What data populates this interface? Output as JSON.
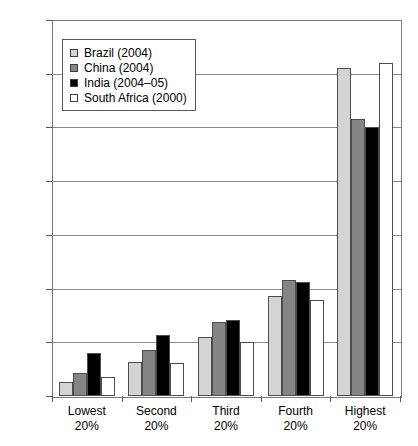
{
  "chart_data": {
    "type": "bar",
    "title": "",
    "xlabel": "",
    "ylabel": "",
    "ylim": [
      0,
      70
    ],
    "yticks": [
      "0.0",
      "10.0",
      "20.0",
      "30.0",
      "40.0",
      "50.0",
      "60.0",
      "70.0"
    ],
    "grid": true,
    "legend_position": "top-left-inside",
    "categories": [
      "Lowest 20%",
      "Second 20%",
      "Third 20%",
      "Fourth 20%",
      "Highest 20%"
    ],
    "category_lines": [
      [
        "Lowest",
        "20%"
      ],
      [
        "Second",
        "20%"
      ],
      [
        "Third",
        "20%"
      ],
      [
        "Fourth",
        "20%"
      ],
      [
        "Highest",
        "20%"
      ]
    ],
    "series": [
      {
        "name": "Brazil (2004)",
        "key": "brazil",
        "color": "#d4d4d4",
        "values": [
          2.7,
          6.4,
          11.0,
          18.6,
          61.0
        ]
      },
      {
        "name": "China (2004)",
        "key": "china",
        "color": "#858585",
        "values": [
          4.3,
          8.5,
          13.7,
          21.6,
          51.5
        ]
      },
      {
        "name": "India (2004–05)",
        "key": "india",
        "color": "#000000",
        "values": [
          8.1,
          11.3,
          14.1,
          21.3,
          50.0
        ]
      },
      {
        "name": "South Africa (2000)",
        "key": "safrica",
        "color": "#ffffff",
        "values": [
          3.5,
          6.2,
          10.0,
          17.8,
          62.0
        ]
      }
    ]
  },
  "legend": {
    "items": [
      {
        "label": "Brazil (2004)"
      },
      {
        "label": "China (2004)"
      },
      {
        "label": "India (2004–05)"
      },
      {
        "label": "South Africa (2000)"
      }
    ]
  }
}
